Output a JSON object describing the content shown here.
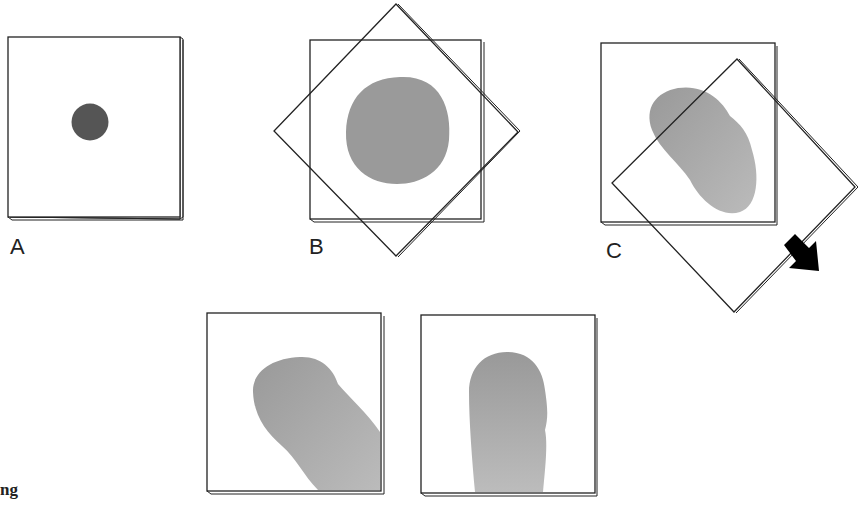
{
  "figure": {
    "panels": [
      {
        "id": "A",
        "label": "A",
        "description": "glass slide with small dark circular drop"
      },
      {
        "id": "B",
        "label": "B",
        "description": "square slide with rotated overlapping coverslip, spread round blob"
      },
      {
        "id": "C",
        "label": "C",
        "description": "rotated coverslip being dragged diagonally, elongated blob"
      },
      {
        "id": "D",
        "label": "",
        "description": "smear elongated diagonally toward bottom-right"
      },
      {
        "id": "E",
        "label": "",
        "description": "smear elongated vertically toward bottom edge"
      }
    ],
    "arrow": {
      "direction": "down-right",
      "color": "#000000"
    },
    "caption_fragment": "ng",
    "colors": {
      "outline": "#222222",
      "drop_dark": "#555555",
      "smear_gray": "#9a9a9a",
      "smear_light": "#b4b4b4",
      "background": "#ffffff"
    }
  }
}
